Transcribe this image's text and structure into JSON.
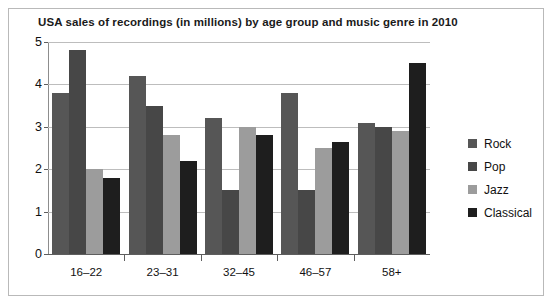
{
  "chart_data": {
    "type": "bar",
    "title": "USA sales of recordings (in millions) by age group and music genre in 2010",
    "xlabel": "",
    "ylabel": "",
    "ylim": [
      0,
      5
    ],
    "yticks": [
      "0",
      "1",
      "2",
      "3",
      "4",
      "5"
    ],
    "grid": true,
    "legend_position": "right",
    "categories": [
      "16–22",
      "23–31",
      "32–45",
      "46–57",
      "58+"
    ],
    "series": [
      {
        "name": "Rock",
        "color": "#565656",
        "values": [
          3.8,
          4.2,
          3.2,
          3.8,
          3.1
        ]
      },
      {
        "name": "Pop",
        "color": "#474747",
        "values": [
          4.8,
          3.5,
          1.5,
          1.5,
          3.0
        ]
      },
      {
        "name": "Jazz",
        "color": "#9c9c9c",
        "values": [
          2.0,
          2.8,
          3.0,
          2.5,
          2.9
        ]
      },
      {
        "name": "Classical",
        "color": "#1e1e1e",
        "values": [
          1.8,
          2.2,
          2.8,
          2.65,
          4.5
        ]
      }
    ]
  },
  "legend": {
    "items": [
      {
        "label": "Rock"
      },
      {
        "label": "Pop"
      },
      {
        "label": "Jazz"
      },
      {
        "label": "Classical"
      }
    ]
  },
  "colors": {
    "rock": "#565656",
    "pop": "#474747",
    "jazz": "#9c9c9c",
    "classical": "#1e1e1e",
    "gridline": "#bdbdbd",
    "axis": "#5e5e5e",
    "frame": "#b9b9b9",
    "text": "#111111",
    "background": "#ffffff"
  }
}
